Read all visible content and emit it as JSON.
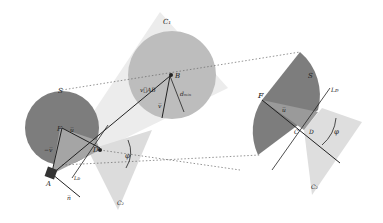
{
  "labels": {
    "C1": "C₁",
    "C2_left": "C₂",
    "C2_right": "C₂",
    "S_left": "S",
    "S_right": "S",
    "B": "B",
    "F_left": "F",
    "F_right": "F",
    "A": "A",
    "D_left": "D",
    "D_right": "D",
    "C_right": "C",
    "u_left": "u̅",
    "u_right": "u̅",
    "neg_v": "−v̅",
    "n": "n̅",
    "v": "v̅",
    "vAB": "v⃗AB",
    "d_min": "dₘᵢₙ",
    "LF_left": "Lᴅ",
    "LF_right": "Lᴅ",
    "phi_left": "φ",
    "phi_right": "φ"
  },
  "colors": {
    "sphere_dark": "#7a7a7a",
    "sphere_B": "#bdbdbd",
    "cone_light": "#e6e6e6",
    "cone_mid": "#d4d4d4",
    "overlap": "#9a9a9a",
    "line": "#333333",
    "dotted": "#666666"
  }
}
